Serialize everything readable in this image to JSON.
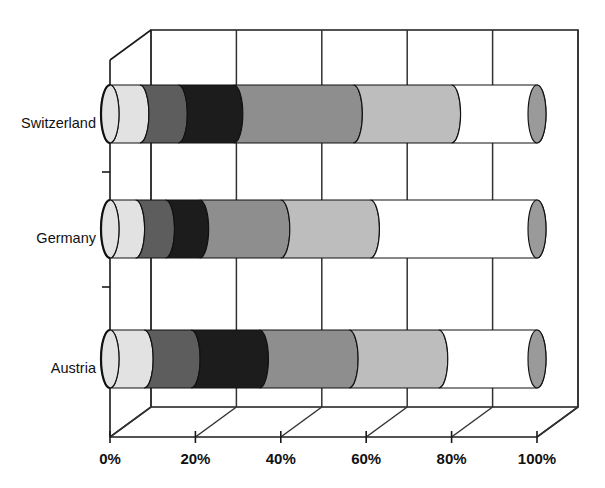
{
  "chart_data": {
    "type": "bar",
    "subtype": "stacked-horizontal-100-percent-3d-cylinder",
    "title": "",
    "subtitle": "",
    "xlabel": "",
    "ylabel": "",
    "categories": [
      "Switzerland",
      "Germany",
      "Austria"
    ],
    "category_order_top_to_bottom": [
      "Switzerland",
      "Germany",
      "Austria"
    ],
    "xticks": [
      0,
      20,
      40,
      60,
      80,
      100
    ],
    "xtick_labels": [
      "0%",
      "20%",
      "40%",
      "60%",
      "80%",
      "100%"
    ],
    "xlim": [
      0,
      100
    ],
    "grid": true,
    "legend": "none",
    "series": [
      {
        "name": "Segment 1",
        "color": "#e2e2e2",
        "values": [
          7,
          6,
          8
        ]
      },
      {
        "name": "Segment 2",
        "color": "#5d5d5d",
        "values": [
          9,
          7,
          11
        ]
      },
      {
        "name": "Segment 3",
        "color": "#1c1c1c",
        "values": [
          13,
          8,
          16
        ]
      },
      {
        "name": "Segment 4",
        "color": "#8e8e8e",
        "values": [
          28,
          19,
          21
        ]
      },
      {
        "name": "Segment 5",
        "color": "#bdbdbd",
        "values": [
          23,
          21,
          21
        ]
      },
      {
        "name": "Segment 6",
        "color": "#ffffff",
        "values": [
          20,
          39,
          23
        ]
      }
    ],
    "cumulative_boundaries_percent": {
      "Switzerland": [
        7,
        16,
        29,
        57,
        80,
        100
      ],
      "Germany": [
        6,
        13,
        21,
        40,
        61,
        100
      ],
      "Austria": [
        8,
        19,
        35,
        56,
        77,
        100
      ]
    },
    "end_cap_color": "#9a9a9a"
  },
  "axis": {
    "x_tick_labels": [
      "0%",
      "20%",
      "40%",
      "60%",
      "80%",
      "100%"
    ],
    "y_labels": [
      "Switzerland",
      "Germany",
      "Austria"
    ]
  }
}
